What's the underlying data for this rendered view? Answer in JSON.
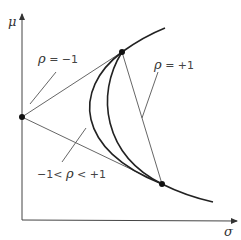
{
  "diagram": {
    "axes": {
      "y_label": "μ",
      "x_label": "σ"
    },
    "labels": {
      "rho_neg_one": {
        "symbol": "ρ",
        "text": " = −1"
      },
      "rho_pos_one": {
        "symbol": "ρ",
        "text": " = +1"
      },
      "rho_between": {
        "prefix": "−1< ",
        "symbol": "ρ",
        "suffix": " < +1"
      }
    },
    "points": [
      "asset-low-risk",
      "asset-mid",
      "asset-high"
    ],
    "curves": [
      "efficient-frontier",
      "correlation-curve-intermediate-1",
      "correlation-curve-intermediate-2",
      "perfect-negative-lines",
      "perfect-positive-line"
    ],
    "colors": {
      "ink": "#222222",
      "thin_line": "#555555",
      "text": "#444444"
    }
  }
}
